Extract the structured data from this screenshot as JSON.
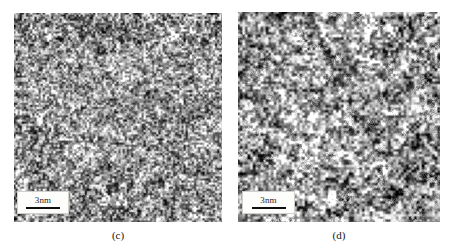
{
  "figure": {
    "background_color": "#ffffff",
    "width": 454,
    "height": 250,
    "panels": [
      {
        "id": "c",
        "caption": "(c)",
        "kind": "hrtem-micrograph",
        "description": "High-resolution TEM micrograph, fine-grained amorphous-like speckle contrast",
        "mean_gray": "#8f8f8f",
        "scalebar": {
          "label": "3nm",
          "bar_color": "#0f0f0f",
          "box_color": "#fdfdfb"
        }
      },
      {
        "id": "d",
        "caption": "(d)",
        "kind": "hrtem-micrograph",
        "description": "High-resolution TEM micrograph, coarser mottled contrast with short lattice fringes",
        "mean_gray": "#909090",
        "scalebar": {
          "label": "3nm",
          "bar_color": "#0f0f0f",
          "box_color": "#fdfdfb"
        }
      }
    ]
  }
}
